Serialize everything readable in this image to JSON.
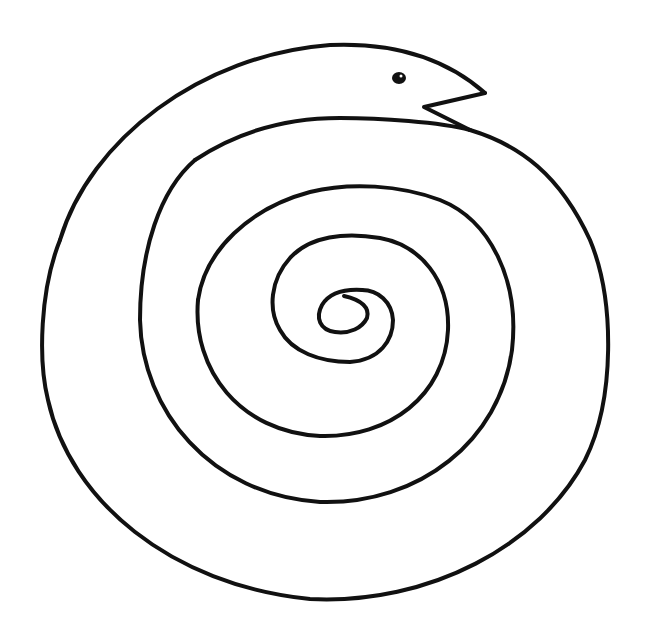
{
  "drawing": {
    "subject": "spiral snake line drawing",
    "stroke_color": "#111111",
    "background_color": "#ffffff",
    "stroke_width": 4
  },
  "parts": {
    "head": {
      "label": "snake-head"
    },
    "eye": {
      "label": "snake-eye"
    },
    "mouth": {
      "label": "snake-mouth"
    },
    "body": {
      "label": "spiral-body"
    }
  }
}
